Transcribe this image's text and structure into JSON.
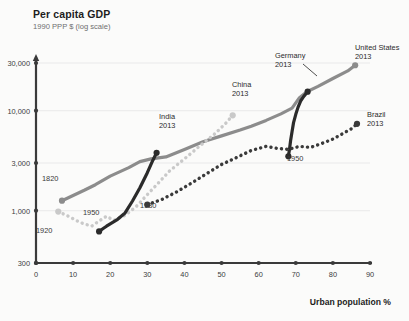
{
  "header": {
    "title": "Per capita GDP",
    "subtitle": "1990 PPP $ (log scale)"
  },
  "axis": {
    "x_label": "Urban population %"
  },
  "annotations": {
    "us_start_year": "1820",
    "china_start_year": "1920",
    "india_start_year": "1950",
    "brazil_start_year": "1930",
    "germany_start_year": "1950"
  },
  "series_labels": {
    "united_states": {
      "name": "United States",
      "year": "2013"
    },
    "germany": {
      "name": "Germany",
      "year": "2013"
    },
    "china": {
      "name": "China",
      "year": "2013"
    },
    "india": {
      "name": "India",
      "year": "2013"
    },
    "brazil": {
      "name": "Brazil",
      "year": "2013"
    }
  },
  "colors": {
    "united_states": "#8c8c8c",
    "germany": "#2b2b2b",
    "china": "#c9c9c9",
    "india": "#2b2b2b",
    "brazil": "#3a3a3a",
    "axis": "#3a3a3a",
    "gridline": "#e2e2e2",
    "background": "#fbfbfa"
  },
  "chart_data": {
    "type": "line",
    "title": "Per capita GDP",
    "subtitle": "1990 PPP $ (log scale)",
    "xlabel": "Urban population %",
    "ylabel": "1990 PPP $ (log scale)",
    "yscale": "log",
    "ylim": [
      300,
      40000
    ],
    "xlim": [
      0,
      90
    ],
    "yticks": [
      300,
      1000,
      3000,
      10000,
      30000
    ],
    "ytick_labels": [
      "300",
      "1,000",
      "3,000",
      "10,000",
      "30,000"
    ],
    "xticks": [
      0,
      10,
      20,
      30,
      40,
      50,
      60,
      70,
      80,
      90
    ],
    "xtick_labels": [
      "0",
      "10",
      "20",
      "30",
      "40",
      "50",
      "60",
      "70",
      "80",
      "90"
    ],
    "grid": "horizontal-faint",
    "legend": "inline-annotations",
    "series": [
      {
        "name": "United States",
        "style": "solid",
        "color": "#8c8c8c",
        "start_label": "1820",
        "end_label": "United States 2013",
        "points": [
          [
            7.0,
            1260
          ],
          [
            10.0,
            1420
          ],
          [
            13.0,
            1600
          ],
          [
            16.0,
            1820
          ],
          [
            20.0,
            2220
          ],
          [
            25.0,
            2700
          ],
          [
            28.0,
            3100
          ],
          [
            31.0,
            3300
          ],
          [
            35.0,
            3450
          ],
          [
            40.0,
            4100
          ],
          [
            45.0,
            4900
          ],
          [
            50.0,
            5600
          ],
          [
            55.0,
            6400
          ],
          [
            58.0,
            7000
          ],
          [
            62.0,
            8000
          ],
          [
            66.0,
            9300
          ],
          [
            69.0,
            10600
          ],
          [
            71.0,
            13500
          ],
          [
            73.0,
            15500
          ],
          [
            76.0,
            17500
          ],
          [
            80.0,
            21000
          ],
          [
            84.0,
            25000
          ],
          [
            86.0,
            28500
          ]
        ]
      },
      {
        "name": "Germany",
        "style": "solid",
        "color": "#2b2b2b",
        "start_label": "1950",
        "end_label": "Germany 2013",
        "points": [
          [
            68.0,
            3500
          ],
          [
            68.3,
            4100
          ],
          [
            68.6,
            5000
          ],
          [
            69.0,
            6200
          ],
          [
            69.4,
            7600
          ],
          [
            70.0,
            9200
          ],
          [
            70.6,
            10800
          ],
          [
            71.3,
            12500
          ],
          [
            72.2,
            14000
          ],
          [
            73.2,
            15500
          ]
        ]
      },
      {
        "name": "China",
        "style": "dotted",
        "color": "#c9c9c9",
        "start_label": "1920",
        "end_label": "China 2013",
        "points": [
          [
            6.0,
            980
          ],
          [
            9.0,
            870
          ],
          [
            12.0,
            760
          ],
          [
            15.0,
            700
          ],
          [
            17.0,
            790
          ],
          [
            19.0,
            880
          ],
          [
            21.0,
            800
          ],
          [
            24.0,
            900
          ],
          [
            27.0,
            1100
          ],
          [
            30.0,
            1450
          ],
          [
            33.0,
            1900
          ],
          [
            36.0,
            2500
          ],
          [
            40.0,
            3300
          ],
          [
            44.0,
            4400
          ],
          [
            48.0,
            5800
          ],
          [
            51.0,
            7400
          ],
          [
            53.0,
            9000
          ]
        ]
      },
      {
        "name": "India",
        "style": "solid",
        "color": "#2b2b2b",
        "start_label": "1950",
        "end_label": "India 2013",
        "points": [
          [
            17.0,
            620
          ],
          [
            18.0,
            660
          ],
          [
            19.0,
            700
          ],
          [
            20.0,
            740
          ],
          [
            22.0,
            820
          ],
          [
            24.0,
            950
          ],
          [
            26.0,
            1250
          ],
          [
            28.0,
            1700
          ],
          [
            30.0,
            2400
          ],
          [
            31.5,
            3200
          ],
          [
            32.5,
            3800
          ]
        ]
      },
      {
        "name": "Brazil",
        "style": "dotted",
        "color": "#3a3a3a",
        "start_label": "1930",
        "end_label": "Brazil 2013",
        "points": [
          [
            30.0,
            1150
          ],
          [
            34.0,
            1300
          ],
          [
            38.0,
            1550
          ],
          [
            42.0,
            1900
          ],
          [
            46.0,
            2350
          ],
          [
            50.0,
            2900
          ],
          [
            54.0,
            3400
          ],
          [
            58.0,
            4000
          ],
          [
            62.0,
            4400
          ],
          [
            65.0,
            4200
          ],
          [
            68.0,
            4100
          ],
          [
            71.0,
            4400
          ],
          [
            74.0,
            4300
          ],
          [
            77.0,
            4700
          ],
          [
            80.0,
            5200
          ],
          [
            83.0,
            6000
          ],
          [
            85.0,
            6600
          ],
          [
            86.5,
            7400
          ]
        ]
      }
    ]
  }
}
